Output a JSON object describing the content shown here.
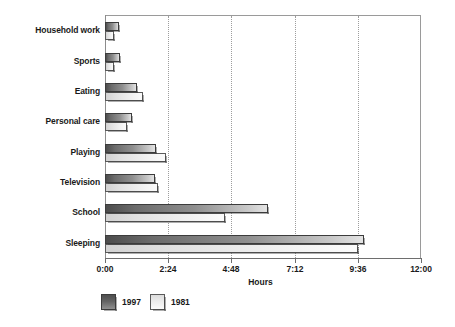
{
  "chart_data": {
    "type": "bar",
    "orientation": "horizontal",
    "title": "",
    "xlabel": "Hours",
    "ylabel": "",
    "xlim": [
      0,
      12
    ],
    "xtick_labels": [
      "0:00",
      "2:24",
      "4:48",
      "7:12",
      "9:36",
      "12:00"
    ],
    "xtick_values": [
      0,
      2.4,
      4.8,
      7.2,
      9.6,
      12
    ],
    "grid": "vertical-dotted",
    "legend_position": "bottom-left",
    "categories": [
      "Household work",
      "Sports",
      "Eating",
      "Personal care",
      "Playing",
      "Television",
      "School",
      "Sleeping"
    ],
    "series": [
      {
        "name": "1997",
        "color": "#6b6b6b",
        "values": [
          0.55,
          0.57,
          1.2,
          1.03,
          1.92,
          1.9,
          6.2,
          9.85
        ],
        "value_labels": [
          "0:33",
          "0:34",
          "1:12",
          "1:02",
          "1:55",
          "1:54",
          "6:12",
          "9:51"
        ]
      },
      {
        "name": "1981",
        "color": "#ededed",
        "values": [
          0.33,
          0.33,
          1.43,
          0.83,
          2.33,
          2.03,
          4.57,
          9.6
        ],
        "value_labels": [
          "0:20",
          "0:20",
          "1:26",
          "0:50",
          "2:20",
          "2:02",
          "4:34",
          "9:36"
        ]
      }
    ]
  },
  "legend": {
    "items": [
      {
        "label": "1997",
        "swatch": "dark-gray-swatch"
      },
      {
        "label": "1981",
        "swatch": "light-gray-swatch"
      }
    ]
  }
}
